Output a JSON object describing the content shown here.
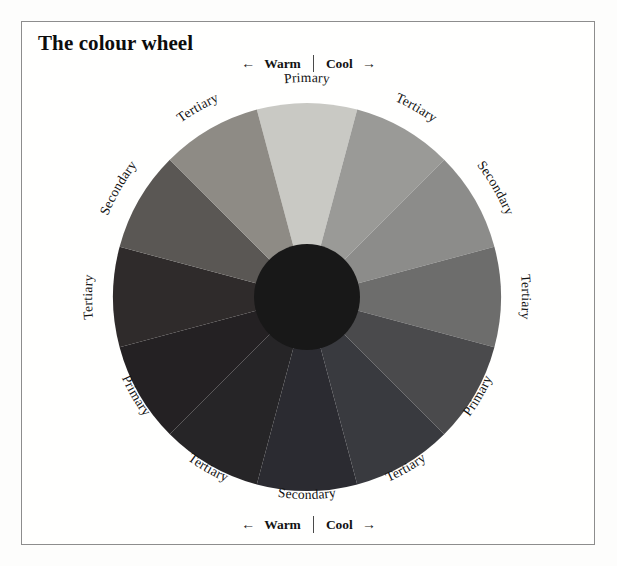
{
  "page": {
    "title": "The colour wheel",
    "background_color": "#fdfdfc",
    "frame_color": "#8d8d8d"
  },
  "axis_top": {
    "left_arrow": "←",
    "warm_label": "Warm",
    "cool_label": "Cool",
    "right_arrow": "→"
  },
  "axis_bottom": {
    "left_arrow": "←",
    "warm_label": "Warm",
    "cool_label": "Cool",
    "right_arrow": "→"
  },
  "chart_data": {
    "type": "pie",
    "title": "The colour wheel",
    "subtitle": "",
    "xlabel": "",
    "ylabel": "",
    "legend_position": "around-circumference",
    "grid": false,
    "note": "Twelve equal 30-degree segments of a colour wheel, reproduced in greyscale. Segment 0 is at the top (12 o'clock) and segments advance clockwise.",
    "center": {
      "x": 307,
      "y": 297
    },
    "outer_radius": 194,
    "hub_radius": 53,
    "hub_color": "#181818",
    "segment_angle_degrees": 30,
    "categories": [
      "Primary",
      "Tertiary",
      "Secondary",
      "Tertiary",
      "Primary",
      "Tertiary",
      "Secondary",
      "Tertiary",
      "Primary",
      "Tertiary",
      "Secondary",
      "Tertiary"
    ],
    "values": [
      30,
      30,
      30,
      30,
      30,
      30,
      30,
      30,
      30,
      30,
      30,
      30
    ],
    "series": [
      {
        "name": "colour wheel segments",
        "values": [
          30,
          30,
          30,
          30,
          30,
          30,
          30,
          30,
          30,
          30,
          30,
          30
        ]
      }
    ],
    "segments": [
      {
        "index": 0,
        "label": "Primary",
        "hue": "yellow",
        "angle_center": 0,
        "angle_start": -15,
        "angle_end": 15,
        "color": "#c9c9c4",
        "temperature": "warm-cool-boundary"
      },
      {
        "index": 1,
        "label": "Tertiary",
        "hue": "yellow-green",
        "angle_center": 30,
        "angle_start": 15,
        "angle_end": 45,
        "color": "#9a9a97",
        "temperature": "cool"
      },
      {
        "index": 2,
        "label": "Secondary",
        "hue": "green",
        "angle_center": 60,
        "angle_start": 45,
        "angle_end": 75,
        "color": "#8c8c8a",
        "temperature": "cool"
      },
      {
        "index": 3,
        "label": "Tertiary",
        "hue": "blue-green",
        "angle_center": 90,
        "angle_start": 75,
        "angle_end": 105,
        "color": "#6d6d6c",
        "temperature": "cool"
      },
      {
        "index": 4,
        "label": "Primary",
        "hue": "blue",
        "angle_center": 120,
        "angle_start": 105,
        "angle_end": 135,
        "color": "#4a4a4c",
        "temperature": "cool"
      },
      {
        "index": 5,
        "label": "Tertiary",
        "hue": "blue-violet",
        "angle_center": 150,
        "angle_start": 135,
        "angle_end": 165,
        "color": "#393a3f",
        "temperature": "cool"
      },
      {
        "index": 6,
        "label": "Secondary",
        "hue": "violet",
        "angle_center": 180,
        "angle_start": 165,
        "angle_end": 195,
        "color": "#2b2b31",
        "temperature": "warm-cool-boundary"
      },
      {
        "index": 7,
        "label": "Tertiary",
        "hue": "red-violet",
        "angle_center": 210,
        "angle_start": 195,
        "angle_end": 225,
        "color": "#262527",
        "temperature": "warm"
      },
      {
        "index": 8,
        "label": "Primary",
        "hue": "red",
        "angle_center": 240,
        "angle_start": 225,
        "angle_end": 255,
        "color": "#242123",
        "temperature": "warm"
      },
      {
        "index": 9,
        "label": "Tertiary",
        "hue": "red-orange",
        "angle_center": 270,
        "angle_start": 255,
        "angle_end": 285,
        "color": "#2f2b2b",
        "temperature": "warm"
      },
      {
        "index": 10,
        "label": "Secondary",
        "hue": "orange",
        "angle_center": 300,
        "angle_start": 285,
        "angle_end": 315,
        "color": "#5a5754",
        "temperature": "warm"
      },
      {
        "index": 11,
        "label": "Tertiary",
        "hue": "yellow-orange",
        "angle_center": 330,
        "angle_start": 315,
        "angle_end": 345,
        "color": "#8e8b85",
        "temperature": "warm"
      }
    ],
    "annotations": [
      {
        "text": "Warm",
        "position": "top-left-of-axis"
      },
      {
        "text": "Cool",
        "position": "top-right-of-axis"
      },
      {
        "text": "Warm",
        "position": "bottom-left-of-axis"
      },
      {
        "text": "Cool",
        "position": "bottom-right-of-axis"
      }
    ]
  }
}
